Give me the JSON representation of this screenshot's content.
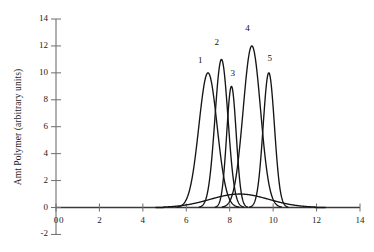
{
  "chart_data": {
    "type": "line",
    "title": "",
    "xlabel": "",
    "ylabel": "Amt Polymer (arbitrary units)",
    "xlim": [
      0,
      14
    ],
    "ylim": [
      -2,
      14
    ],
    "xticks": [
      0,
      2,
      4,
      6,
      8,
      10,
      12,
      14
    ],
    "yticks": [
      -2,
      0,
      2,
      4,
      6,
      8,
      10,
      12,
      14
    ],
    "xtick_labels": [
      "0",
      "2",
      "4",
      "6",
      "8",
      "10",
      "12",
      "14"
    ],
    "ytick_labels": [
      "-2",
      "0",
      "2",
      "4",
      "6",
      "8",
      "10",
      "12",
      "14"
    ],
    "grid": false,
    "legend": "none",
    "line_color": "#151515",
    "axis_color": "#6f6f6f",
    "background": "#ffffff",
    "origin_label": "0",
    "series": [
      {
        "name": "1",
        "peak_x": 7.0,
        "peak_y": 10,
        "width": 0.42,
        "label": "1",
        "label_x": 6.72,
        "label_y": 10.85
      },
      {
        "name": "2",
        "peak_x": 7.62,
        "peak_y": 11,
        "width": 0.3,
        "label": "2",
        "label_x": 7.48,
        "label_y": 12.25
      },
      {
        "name": "3",
        "peak_x": 8.08,
        "peak_y": 9,
        "width": 0.22,
        "label": "3",
        "label_x": 8.22,
        "label_y": 9.95
      },
      {
        "name": "4",
        "peak_x": 9.02,
        "peak_y": 12,
        "width": 0.4,
        "label": "4",
        "label_x": 8.9,
        "label_y": 13.25
      },
      {
        "name": "5",
        "peak_x": 9.8,
        "peak_y": 10,
        "width": 0.26,
        "label": "5",
        "label_x": 9.92,
        "label_y": 11.05
      }
    ],
    "envelope": {
      "name": "overall-distribution",
      "peak_x": 8.5,
      "peak_y": 0,
      "description": "broad baseline envelope spanning approximately x = 6.0 to x = 11.0"
    }
  },
  "axes": {
    "y_title": "Amt Polymer (arbitrary units)"
  }
}
